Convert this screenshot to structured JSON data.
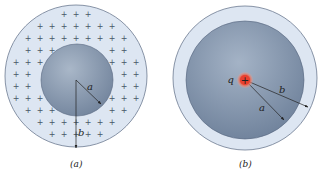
{
  "figure_a": {
    "caption": "(a)",
    "inner_radius_label": "a",
    "outer_radius_label": "b",
    "charge_symbol": "+",
    "colors": {
      "outer_fill": "#dde6f2",
      "outer_stroke": "#6c7a90",
      "inner_fill_light": "#a9b7c8",
      "inner_fill_dark": "#6f819a"
    }
  },
  "figure_b": {
    "caption": "(b)",
    "charge_label": "q",
    "charge_symbol": "+",
    "inner_radius_label": "a",
    "outer_radius_label": "b",
    "colors": {
      "shell_fill": "#dde6f2",
      "inner_fill_light": "#a4b3c6",
      "inner_fill_dark": "#6a7d97",
      "charge_fill": "#e8402f",
      "charge_glow": "#f7a08a"
    }
  }
}
